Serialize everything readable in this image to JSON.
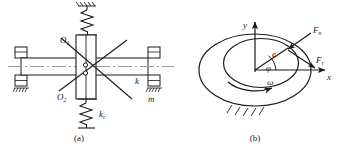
{
  "figure": {
    "type": "engineering-diagram",
    "background": "#ffffff",
    "stroke_color": "#1a1a1a",
    "axis_line_color": "#8a8a8a",
    "panels": [
      {
        "id": "a",
        "caption": "(a)",
        "title_semantic": "rotor-shaft-bearing-schematic",
        "labels": [
          {
            "name": "center-o1",
            "text": "O",
            "subscript": "1"
          },
          {
            "name": "center-o2",
            "text": "O",
            "subscript": "2"
          },
          {
            "name": "spring-stiffness-k",
            "text": "k",
            "subscript": ""
          },
          {
            "name": "mass-m",
            "text": "m",
            "subscript": ""
          },
          {
            "name": "spring-stiffness-kc",
            "text": "k",
            "subscript": "c"
          }
        ],
        "components": [
          {
            "name": "upper-spring",
            "label": "k"
          },
          {
            "name": "lower-spring",
            "label": "kc"
          },
          {
            "name": "left-bearing",
            "label": ""
          },
          {
            "name": "right-bearing",
            "label": "m"
          },
          {
            "name": "center-disk",
            "label": ""
          },
          {
            "name": "shaft-centerline",
            "label": ""
          }
        ]
      },
      {
        "id": "b",
        "caption": "(b)",
        "title_semantic": "journal-bearing-eccentricity-diagram",
        "labels": [
          {
            "name": "axis-x",
            "text": "x",
            "subscript": ""
          },
          {
            "name": "axis-y",
            "text": "y",
            "subscript": ""
          },
          {
            "name": "eccentricity-e",
            "text": "e",
            "subscript": ""
          },
          {
            "name": "attitude-angle-phi",
            "text": "φ",
            "subscript": ""
          },
          {
            "name": "angular-velocity-omega",
            "text": "ω",
            "subscript": ""
          },
          {
            "name": "normal-force-fn",
            "text": "F",
            "subscript": "n"
          },
          {
            "name": "tangential-force-ft",
            "text": "F",
            "subscript": "τ"
          }
        ]
      }
    ]
  }
}
